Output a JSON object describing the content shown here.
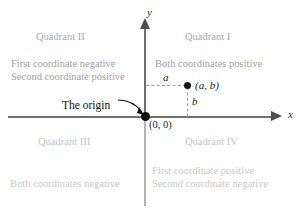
{
  "figure": {
    "axes": {
      "x_label": "x",
      "y_label": "y"
    },
    "origin": {
      "callout": "The origin",
      "coordinates": "(0, 0)"
    },
    "point": {
      "label": "(a, b)",
      "x_segment_label": "a",
      "y_segment_label": "b"
    },
    "quadrants": [
      {
        "title": "Quadrant II",
        "line1": "First coordinate negative",
        "line2": "Second coordinate positive"
      },
      {
        "title": "Quadrant I",
        "line1": "Both coordinates positive",
        "line2": ""
      },
      {
        "title": "Quadrant III",
        "line1": "Both coordinates negative",
        "line2": ""
      },
      {
        "title": "Quadrant IV",
        "line1": "First coordinate positive",
        "line2": "Second coordinate negative"
      }
    ],
    "colors": {
      "axis": "#6e6e6e",
      "axis_faded": "#b4b4b4",
      "label_gray": "#a0a0a0",
      "label_gray_faint": "#c9c9c9",
      "ink": "#111111",
      "dash": "#9a9a9a"
    }
  }
}
